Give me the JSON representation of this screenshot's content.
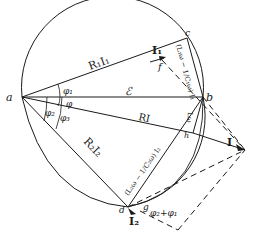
{
  "diagram": {
    "points": {
      "a": {
        "label": "a",
        "x": 22,
        "y": 97
      },
      "b": {
        "label": "b",
        "x": 203,
        "y": 97
      },
      "c": {
        "label": "c",
        "x": 187,
        "y": 38
      },
      "d": {
        "label": "d",
        "x": 128,
        "y": 207
      },
      "f": {
        "label": "f",
        "x": 162,
        "y": 60
      },
      "h": {
        "label": "h",
        "x": 193,
        "y": 133
      },
      "g": {
        "label": "g",
        "x": 140,
        "y": 211
      },
      "I": {
        "label": "I",
        "x": 245,
        "y": 150
      }
    },
    "labels": {
      "R1I1": "R₁I₁",
      "I1": "I₁",
      "E": "ℰ",
      "RI": "RI",
      "R2I2": "R₂I₂",
      "I2": "I₂",
      "I": "I",
      "phi": "φ",
      "phi1": "φ₁",
      "phi2": "φ₂",
      "phi3": "φ₃",
      "phi_sum": "φ₂+φ₁",
      "reactance1": "(L₁ω − 1/C₁ω) I₁",
      "reactance2": "(L₂ω − 1/C₂ω) I₂",
      "reactance_total": "Lω"
    },
    "colors": {
      "ink": "#1a1a1a",
      "background": "#ffffff"
    }
  }
}
